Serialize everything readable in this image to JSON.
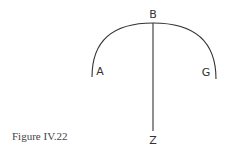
{
  "figure": {
    "caption": "Figure IV.22",
    "points": {
      "A": "A",
      "B": "B",
      "G": "G",
      "Z": "Z"
    },
    "stroke_color": "#333333"
  }
}
